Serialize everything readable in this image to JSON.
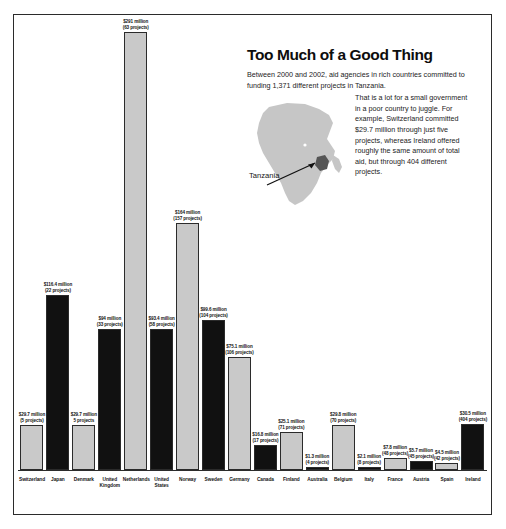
{
  "headline": "Too Much of a Good Thing",
  "lede": "Between 2000 and 2002, aid agencies in rich countries committed to funding 1,371 different projects in Tanzania.",
  "body": "That is a lot for a small government in a poor country to juggle. For example, Switzerland committed $29.7 million through just five projects, whereas Ireland offered roughly the same amount of total aid, but through 404 different projects.",
  "map": {
    "region_label": "Tanzania",
    "continent": "Africa",
    "continent_fill": "#c6c6c6",
    "highlight_fill": "#555555"
  },
  "colors": {
    "bar_light": "#c9c9c9",
    "bar_dark": "#111111",
    "outline": "#2b2b2b",
    "text": "#141414"
  },
  "chart_data": {
    "type": "bar",
    "title": "Too Much of a Good Thing",
    "xlabel": "",
    "ylabel": "",
    "ylim": [
      0,
      291
    ],
    "grid": false,
    "legend": "none",
    "categories": [
      "Switzerland",
      "Japan",
      "Denmark",
      "United Kingdom",
      "Netherlands",
      "United States",
      "Norway",
      "Sweden",
      "Germany",
      "Canada",
      "Finland",
      "Australia",
      "Belgium",
      "Italy",
      "France",
      "Austria",
      "Spain",
      "Ireland"
    ],
    "values": [
      29.7,
      116.4,
      29.7,
      94,
      291,
      93.4,
      164,
      99.6,
      75.1,
      16.8,
      25.1,
      1.3,
      29.8,
      2.1,
      7.8,
      5.7,
      4.5,
      30.5
    ],
    "projects": [
      5,
      22,
      5,
      33,
      63,
      58,
      157,
      104,
      106,
      17,
      71,
      4,
      70,
      8,
      48,
      45,
      42,
      404
    ],
    "value_labels": [
      "$29.7 million",
      "$116.4 million",
      "$29.7 million",
      "$94 million",
      "$291 million",
      "$93.4 million",
      "$164 million",
      "$99.6 million",
      "$75.1 million",
      "$16.8 million",
      "$25.1 million",
      "$1.3 million",
      "$29.8 million",
      "$2.1 million",
      "$7.8 million",
      "$5.7 million",
      "$4.5 million",
      "$30.5 million"
    ],
    "project_labels": [
      "(5 projects)",
      "(22 projects)",
      "5 projects",
      "(33 projects)",
      "(63 projects)",
      "(58 projects)",
      "(157 projects)",
      "(104 projects)",
      "(106 projects)",
      "(17 projects)",
      "(71 projects)",
      "(4 projects)",
      "(70 projects)",
      "(8 projects)",
      "(48 projects)",
      "(45 projects)",
      "(42 projects)",
      "(404 projects)"
    ],
    "bar_styles": [
      "light",
      "dark",
      "light",
      "dark",
      "light",
      "dark",
      "light",
      "dark",
      "light",
      "dark",
      "light",
      "dark",
      "light",
      "dark",
      "light",
      "dark",
      "light",
      "dark"
    ]
  }
}
